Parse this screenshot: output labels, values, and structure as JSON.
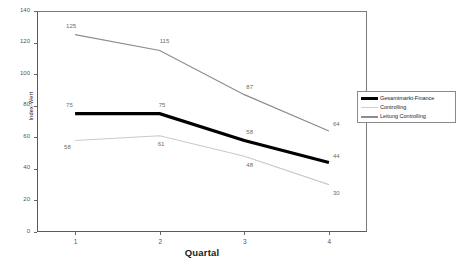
{
  "chart_data": {
    "type": "line",
    "title": "",
    "xlabel": "Quartal",
    "ylabel": "Index-Wert",
    "categories": [
      "1",
      "2",
      "3",
      "4"
    ],
    "x": [
      1,
      2,
      3,
      4
    ],
    "xlim": [
      0.55,
      4.45
    ],
    "ylim": [
      0,
      140
    ],
    "ytick_labels": [
      "0",
      "20",
      "40",
      "60",
      "80",
      "100",
      "120",
      "140"
    ],
    "yticks": [
      0,
      20,
      40,
      60,
      80,
      100,
      120,
      140
    ],
    "grid": false,
    "legend_position": "right",
    "series": [
      {
        "name": "Gesamtmarkt-Finance",
        "color": "#000000",
        "width": 3.2,
        "values": [
          75,
          75,
          58,
          44
        ],
        "labels": [
          "75",
          "75",
          "58",
          "44"
        ]
      },
      {
        "name": "Controlling",
        "color": "#c9c9c9",
        "width": 1.1,
        "values": [
          58,
          61,
          48,
          30
        ],
        "labels": [
          "58",
          "61",
          "48",
          "30"
        ]
      },
      {
        "name": "Leitung Controlling",
        "color": "#8c8c8c",
        "width": 1.2,
        "values": [
          125,
          115,
          87,
          64
        ],
        "labels": [
          "125",
          "115",
          "87",
          "64"
        ]
      }
    ]
  },
  "legend": {
    "entries": [
      {
        "label": "Gesamtmarkt-Finance"
      },
      {
        "label": "Controlling"
      },
      {
        "label": "Leitung Controlling"
      }
    ]
  },
  "axes": {
    "y_title": "Index-Wert",
    "x_title": "Quartal"
  }
}
